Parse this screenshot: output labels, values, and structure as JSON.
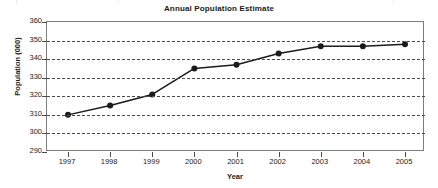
{
  "chart_data": {
    "type": "line",
    "title": "Annual Population Estimate",
    "xlabel": "Year",
    "ylabel": "Population (000)",
    "categories": [
      "1997",
      "1998",
      "1999",
      "2000",
      "2001",
      "2002",
      "2003",
      "2004",
      "2005"
    ],
    "x": [
      1997,
      1998,
      1999,
      2000,
      2001,
      2002,
      2003,
      2004,
      2005
    ],
    "values": [
      310,
      315,
      321,
      335,
      337,
      343,
      347,
      347,
      348
    ],
    "series": [
      {
        "name": "Annual Population Estimate",
        "values": [
          310,
          315,
          321,
          335,
          337,
          343,
          347,
          347,
          348
        ]
      }
    ],
    "ylim": [
      290,
      360
    ],
    "yticks": [
      290,
      300,
      310,
      320,
      330,
      340,
      350,
      360
    ],
    "ytick_labels": [
      "290",
      "300",
      "310",
      "320",
      "330",
      "340",
      "350",
      "360"
    ],
    "xlim": [
      1997,
      2005
    ],
    "grid": "horizontal-dashed",
    "legend": "none",
    "marker": "filled-circle",
    "line_color": "#1b1b1b",
    "marker_color": "#1b1b1b",
    "grid_color": "#4a4a4a",
    "axis_color": "#7e7e7e",
    "background": "#ffffff"
  }
}
